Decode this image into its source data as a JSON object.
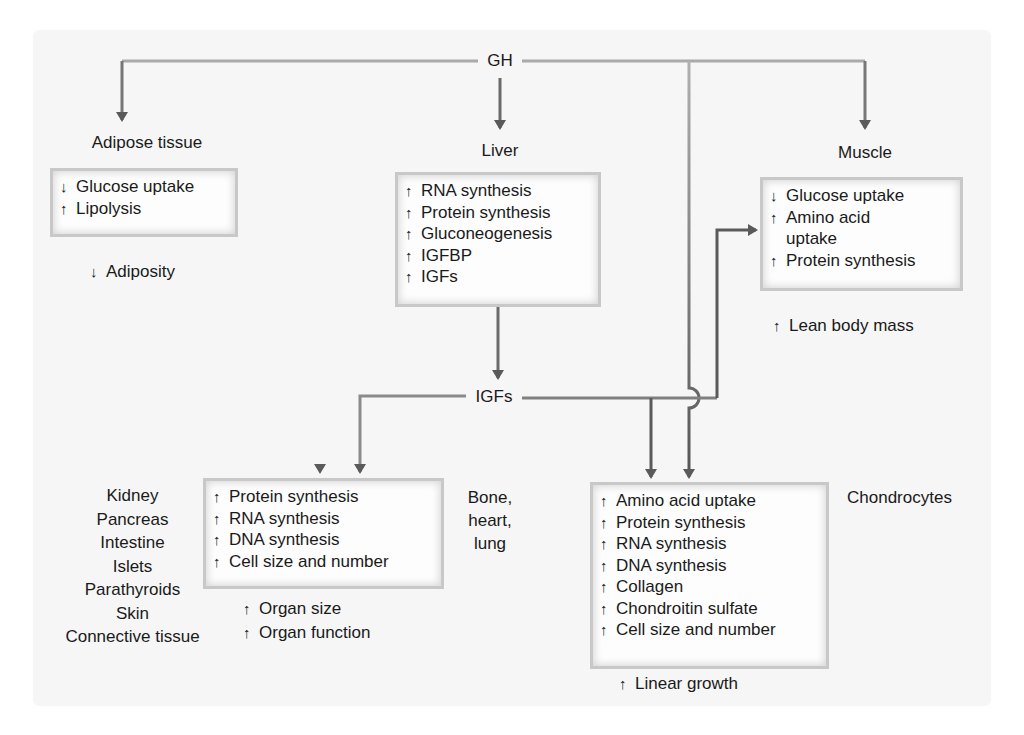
{
  "colors": {
    "panel_bg": "#f6f6f6",
    "line_light": "#a8a8a8",
    "line_dark": "#5a5a5a",
    "box_edge": "#c8c8c8",
    "text": "#1a1a1a"
  },
  "nodes": {
    "gh": "GH",
    "igfs": "IGFs",
    "adipose": {
      "title": "Adipose tissue",
      "effects": [
        {
          "dir": "↓",
          "text": "Glucose uptake"
        },
        {
          "dir": "↑",
          "text": "Lipolysis"
        }
      ],
      "outcome": {
        "dir": "↓",
        "text": "Adiposity"
      }
    },
    "liver": {
      "title": "Liver",
      "effects": [
        {
          "dir": "↑",
          "text": "RNA synthesis"
        },
        {
          "dir": "↑",
          "text": "Protein synthesis"
        },
        {
          "dir": "↑",
          "text": "Gluconeogenesis"
        },
        {
          "dir": "↑",
          "text": "IGFBP"
        },
        {
          "dir": "↑",
          "text": "IGFs"
        }
      ]
    },
    "muscle": {
      "title": "Muscle",
      "effects": [
        {
          "dir": "↓",
          "text": "Glucose uptake"
        },
        {
          "dir": "↑",
          "text": "Amino acid"
        },
        {
          "dir": "",
          "text": "uptake"
        },
        {
          "dir": "↑",
          "text": "Protein synthesis"
        }
      ],
      "outcome": {
        "dir": "↑",
        "text": "Lean body mass"
      }
    },
    "organs": {
      "tissues": [
        "Kidney",
        "Pancreas",
        "Intestine",
        "Islets",
        "Parathyroids",
        "Skin",
        "Connective tissue"
      ],
      "effects": [
        {
          "dir": "↑",
          "text": "Protein synthesis"
        },
        {
          "dir": "↑",
          "text": "RNA synthesis"
        },
        {
          "dir": "↑",
          "text": "DNA synthesis"
        },
        {
          "dir": "↑",
          "text": "Cell size and number"
        }
      ],
      "outcomes": [
        {
          "dir": "↑",
          "text": "Organ size"
        },
        {
          "dir": "↑",
          "text": "Organ function"
        }
      ]
    },
    "bone_heart_lung": [
      "Bone,",
      "heart,",
      "lung"
    ],
    "chondrocytes": {
      "title": "Chondrocytes",
      "effects": [
        {
          "dir": "↑",
          "text": "Amino acid uptake"
        },
        {
          "dir": "↑",
          "text": "Protein synthesis"
        },
        {
          "dir": "↑",
          "text": "RNA synthesis"
        },
        {
          "dir": "↑",
          "text": "DNA synthesis"
        },
        {
          "dir": "↑",
          "text": "Collagen"
        },
        {
          "dir": "↑",
          "text": "Chondroitin sulfate"
        },
        {
          "dir": "↑",
          "text": "Cell size and number"
        }
      ],
      "outcome": {
        "dir": "↑",
        "text": "Linear growth"
      }
    }
  },
  "edges": [
    {
      "from": "GH",
      "to": "Adipose tissue"
    },
    {
      "from": "GH",
      "to": "Liver"
    },
    {
      "from": "GH",
      "to": "Muscle"
    },
    {
      "from": "GH",
      "to": "Organ box"
    },
    {
      "from": "GH",
      "to": "Chondrocytes box"
    },
    {
      "from": "Liver",
      "to": "IGFs"
    },
    {
      "from": "IGFs",
      "to": "Organ box"
    },
    {
      "from": "IGFs",
      "to": "Chondrocytes box"
    },
    {
      "from": "IGFs",
      "to": "Muscle box"
    }
  ]
}
